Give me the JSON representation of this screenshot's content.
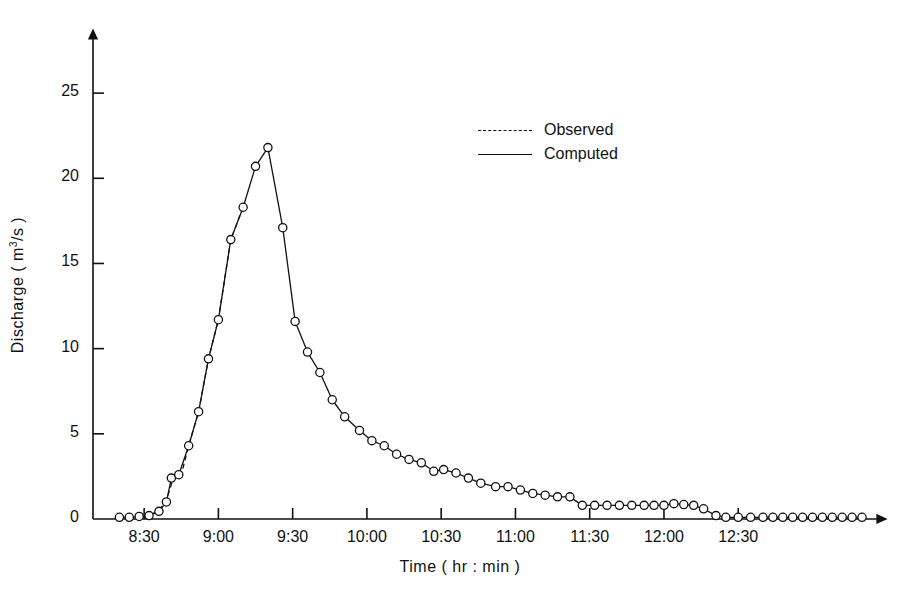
{
  "chart_data": {
    "type": "line",
    "title": "",
    "xlabel": "Time ( hr : min )",
    "ylabel": "Discharge ( m3/s )",
    "ylabel_parts": {
      "prefix": "Discharge  ( m",
      "sup": "3",
      "suffix": "/s )"
    },
    "ylim": [
      0,
      28
    ],
    "yticks": [
      0,
      5,
      10,
      15,
      20,
      25
    ],
    "ytick_labels": [
      "0",
      "5",
      "10",
      "15",
      "20",
      "25"
    ],
    "xlim_minutes": [
      495,
      800
    ],
    "xticks_minutes": [
      510,
      540,
      570,
      600,
      630,
      660,
      690,
      720,
      750
    ],
    "xtick_labels": [
      "8:30",
      "9:00",
      "9:30",
      "10:00",
      "10:30",
      "11:00",
      "11:30",
      "12:00",
      "12:30"
    ],
    "grid": false,
    "legend_position": "upper-center",
    "marker": "open-circle",
    "series": [
      {
        "name": "Observed",
        "style": "dashed",
        "points": [
          [
            503,
            0.1
          ],
          [
            508,
            0.15
          ],
          [
            512,
            0.2
          ],
          [
            516,
            0.5
          ],
          [
            519,
            1.1
          ],
          [
            522,
            2.5
          ],
          [
            525,
            2.6
          ],
          [
            528,
            4.3
          ],
          [
            532,
            6.3
          ],
          [
            536,
            9.4
          ],
          [
            540,
            11.7
          ],
          [
            545,
            16.4
          ],
          [
            550,
            18.3
          ]
        ]
      },
      {
        "name": "Computed",
        "style": "solid",
        "points": [
          [
            500,
            0.1
          ],
          [
            504,
            0.1
          ],
          [
            508,
            0.15
          ],
          [
            512,
            0.2
          ],
          [
            516,
            0.45
          ],
          [
            519,
            1.0
          ],
          [
            521,
            2.4
          ],
          [
            524,
            2.6
          ],
          [
            528,
            4.3
          ],
          [
            532,
            6.3
          ],
          [
            536,
            9.4
          ],
          [
            540,
            11.7
          ],
          [
            545,
            16.4
          ],
          [
            550,
            18.3
          ],
          [
            555,
            20.7
          ],
          [
            560,
            21.8
          ],
          [
            566,
            17.1
          ],
          [
            571,
            11.6
          ],
          [
            576,
            9.8
          ],
          [
            581,
            8.6
          ],
          [
            586,
            7.0
          ],
          [
            591,
            6.0
          ],
          [
            597,
            5.2
          ],
          [
            602,
            4.6
          ],
          [
            607,
            4.3
          ],
          [
            612,
            3.8
          ],
          [
            617,
            3.5
          ],
          [
            622,
            3.3
          ],
          [
            627,
            2.8
          ],
          [
            631,
            2.9
          ],
          [
            636,
            2.7
          ],
          [
            641,
            2.4
          ],
          [
            646,
            2.1
          ],
          [
            652,
            1.9
          ],
          [
            657,
            1.9
          ],
          [
            662,
            1.7
          ],
          [
            667,
            1.5
          ],
          [
            672,
            1.4
          ],
          [
            677,
            1.3
          ],
          [
            682,
            1.3
          ],
          [
            687,
            0.8
          ],
          [
            692,
            0.8
          ],
          [
            697,
            0.8
          ],
          [
            702,
            0.8
          ],
          [
            707,
            0.8
          ],
          [
            712,
            0.8
          ],
          [
            716,
            0.8
          ],
          [
            720,
            0.8
          ],
          [
            724,
            0.9
          ],
          [
            728,
            0.85
          ],
          [
            732,
            0.8
          ],
          [
            736,
            0.6
          ],
          [
            741,
            0.2
          ],
          [
            745,
            0.1
          ],
          [
            750,
            0.1
          ],
          [
            755,
            0.1
          ],
          [
            760,
            0.1
          ],
          [
            764,
            0.1
          ],
          [
            768,
            0.1
          ],
          [
            772,
            0.1
          ],
          [
            776,
            0.1
          ],
          [
            780,
            0.1
          ],
          [
            784,
            0.1
          ],
          [
            788,
            0.1
          ],
          [
            792,
            0.1
          ],
          [
            796,
            0.1
          ],
          [
            800,
            0.1
          ]
        ]
      }
    ],
    "legend_entries": [
      {
        "label": "Observed",
        "style": "dashed"
      },
      {
        "label": "Computed",
        "style": "solid"
      }
    ]
  }
}
